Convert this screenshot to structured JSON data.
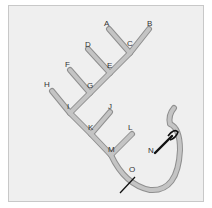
{
  "figure": {
    "type": "branching-tube-diagram",
    "labels": {
      "A": "A",
      "B": "B",
      "C": "C",
      "D": "D",
      "E": "E",
      "F": "F",
      "G": "G",
      "H": "H",
      "I": "I",
      "J": "J",
      "K": "K",
      "L": "L",
      "M": "M",
      "N": "N",
      "O": "O"
    },
    "colors": {
      "background": "#efefef",
      "frame_border": "#c8c8c8",
      "tube_fill": "#c4c4c4",
      "tube_outline": "#8f8f8f",
      "needle": "#111111",
      "label": "#333333"
    }
  }
}
